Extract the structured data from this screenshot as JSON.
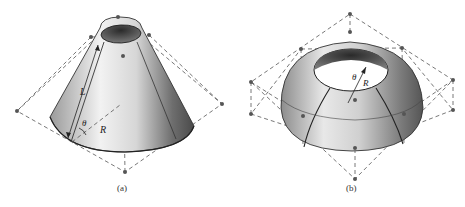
{
  "figures": [
    {
      "id": "a",
      "caption": "(a)",
      "shape": "truncated cone",
      "labels": {
        "slant": "L",
        "angle": "θ",
        "radius": "R"
      }
    },
    {
      "id": "b",
      "caption": "(b)",
      "shape": "spherical zone (dome with top opening)",
      "labels": {
        "angle": "θ",
        "radius": "R"
      }
    }
  ],
  "colors": {
    "line": "#333333",
    "dash": "#555555",
    "node": "#555555"
  }
}
